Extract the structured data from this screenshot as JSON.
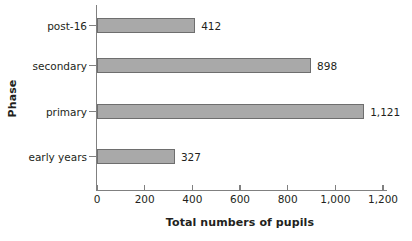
{
  "chart_data": {
    "type": "bar",
    "orientation": "horizontal",
    "title": "",
    "xlabel": "Total numbers of pupils",
    "ylabel": "Phase",
    "categories": [
      "early years",
      "primary",
      "secondary",
      "post-16"
    ],
    "values": [
      327,
      1121,
      898,
      412
    ],
    "value_labels": [
      "327",
      "1,121",
      "898",
      "412"
    ],
    "xlim": [
      0,
      1200
    ],
    "xticks": [
      0,
      200,
      400,
      600,
      800,
      1000,
      1200
    ],
    "xtick_labels": [
      "0",
      "200",
      "400",
      "600",
      "800",
      "1,000",
      "1,200"
    ],
    "grid": false,
    "legend": false,
    "bar_fill_color": "#a9a9a9",
    "bar_border_color": "#6e6e6e",
    "axis_color": "#808080",
    "text_color": "#231f20",
    "background_color": "#ffffff"
  }
}
